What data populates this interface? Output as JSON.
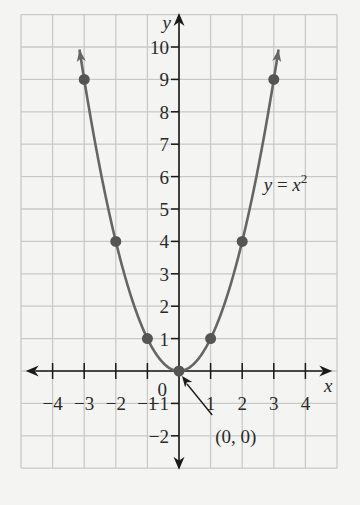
{
  "chart_data": {
    "type": "line",
    "title": "",
    "equation_label": {
      "lhs": "y",
      "eq": " = ",
      "rhs": "x",
      "exp": "2"
    },
    "xlabel": "x",
    "ylabel": "y",
    "xlim": [
      -4.5,
      4.5
    ],
    "ylim": [
      -3,
      11
    ],
    "grid": true,
    "x_ticks": [
      -4,
      -3,
      -2,
      -1,
      1,
      2,
      3,
      4
    ],
    "x_tick_labels": [
      "−4",
      "−3",
      "−2",
      "−1",
      "1",
      "2",
      "3",
      "4"
    ],
    "y_ticks": [
      -2,
      -1,
      1,
      2,
      3,
      4,
      5,
      6,
      7,
      8,
      9,
      10
    ],
    "y_tick_labels": [
      "−2",
      "−1",
      "1",
      "2",
      "3",
      "4",
      "5",
      "6",
      "7",
      "8",
      "9",
      "10"
    ],
    "origin_label": "0",
    "series": [
      {
        "name": "y = x^2",
        "function": "x^2",
        "x_range": [
          -3.15,
          3.15
        ],
        "arrows_at_ends": true
      }
    ],
    "points": [
      {
        "x": -3,
        "y": 9
      },
      {
        "x": -2,
        "y": 4
      },
      {
        "x": -1,
        "y": 1
      },
      {
        "x": 0,
        "y": 0
      },
      {
        "x": 1,
        "y": 1
      },
      {
        "x": 2,
        "y": 4
      },
      {
        "x": 3,
        "y": 9
      }
    ],
    "annotations": [
      {
        "text": "(0, 0)",
        "points_to": {
          "x": 0,
          "y": 0
        }
      }
    ],
    "colors": {
      "background": "#f4f4f3",
      "grid": "#c9c9c9",
      "axis": "#1a1a1a",
      "curve": "#666666",
      "points": "#555555"
    }
  }
}
